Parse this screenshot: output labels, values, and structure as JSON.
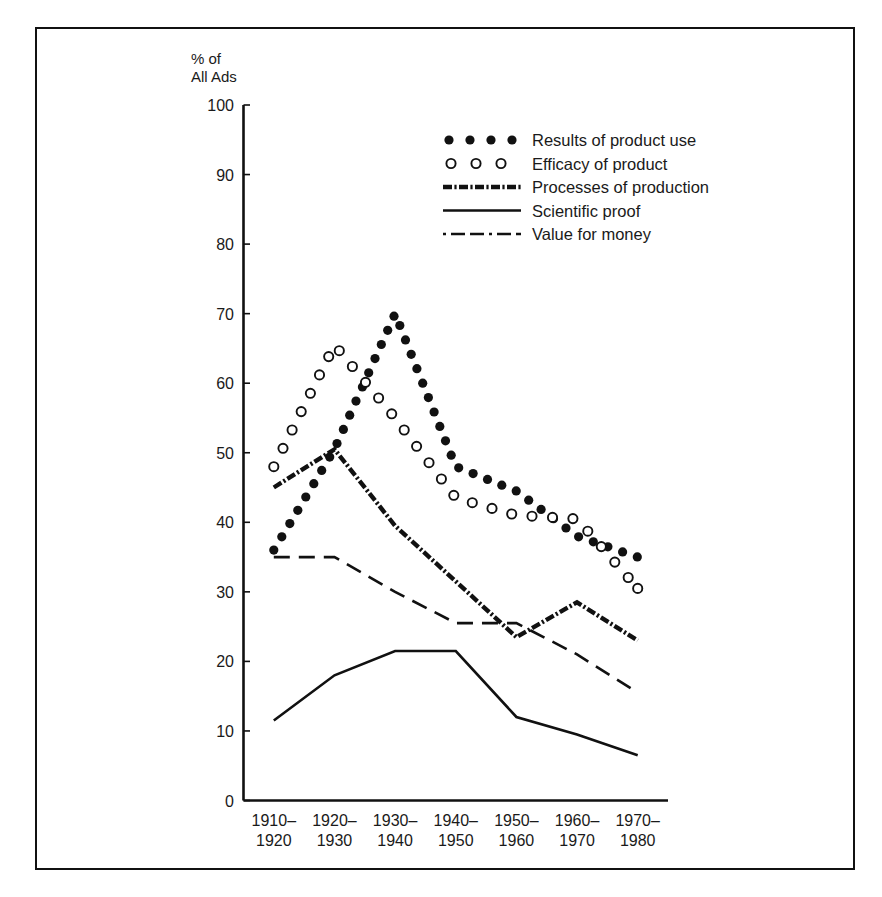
{
  "chart_data": {
    "type": "line",
    "title": "",
    "subtitle": "",
    "xlabel": "",
    "ylabel": "% of\nAll Ads",
    "ylabel_line1": "% of",
    "ylabel_line2": "All Ads",
    "ylim": [
      0,
      100
    ],
    "ytick_step": 10,
    "yticks": [
      0,
      10,
      20,
      30,
      40,
      50,
      60,
      70,
      80,
      90,
      100
    ],
    "ytick_labels": [
      "0",
      "10",
      "20",
      "30",
      "40",
      "50",
      "60",
      "70",
      "80",
      "90",
      "100"
    ],
    "grid": false,
    "legend_position": "upper-center",
    "categories": [
      "1910-1920",
      "1920-1930",
      "1930-1940",
      "1940-1950",
      "1950-1960",
      "1960-1970",
      "1970-1980"
    ],
    "xtick_labels": [
      {
        "top": "1910–",
        "bottom": "1920"
      },
      {
        "top": "1920–",
        "bottom": "1930"
      },
      {
        "top": "1930–",
        "bottom": "1940"
      },
      {
        "top": "1940–",
        "bottom": "1950"
      },
      {
        "top": "1950–",
        "bottom": "1960"
      },
      {
        "top": "1960–",
        "bottom": "1970"
      },
      {
        "top": "1970–",
        "bottom": "1980"
      }
    ],
    "series": [
      {
        "name": "Results of product use",
        "style": "dotted-filled",
        "marker": "filled-circle",
        "color": "#111111",
        "values": [
          36,
          50.5,
          70,
          48,
          44.5,
          38,
          35
        ]
      },
      {
        "name": "Efficacy of product",
        "style": "dotted-open",
        "marker": "open-circle",
        "color": "#111111",
        "values": [
          48,
          65.5,
          55,
          43.5,
          41,
          40.5,
          30.5
        ]
      },
      {
        "name": "Processes of production",
        "style": "dot-dash-thick",
        "marker": "none",
        "color": "#111111",
        "values": [
          45,
          50.5,
          39.5,
          31.5,
          23.5,
          28.5,
          23
        ]
      },
      {
        "name": "Scientific proof",
        "style": "solid",
        "marker": "none",
        "color": "#111111",
        "values": [
          11.5,
          18,
          21.5,
          21.5,
          12,
          9.5,
          6.5
        ]
      },
      {
        "name": "Value for money",
        "style": "dashed",
        "marker": "none",
        "color": "#111111",
        "values": [
          35,
          35,
          30,
          25.5,
          25.5,
          21,
          15.5
        ]
      }
    ],
    "legend": [
      {
        "label": "Results of product use",
        "style": "dotted-filled"
      },
      {
        "label": "Efficacy of product",
        "style": "dotted-open"
      },
      {
        "label": "Processes of production",
        "style": "dot-dash-thick"
      },
      {
        "label": "Scientific proof",
        "style": "solid"
      },
      {
        "label": "Value for money",
        "style": "dashed"
      }
    ],
    "colors": {
      "ink": "#111111",
      "background": "#ffffff",
      "frame": "#111111"
    }
  }
}
